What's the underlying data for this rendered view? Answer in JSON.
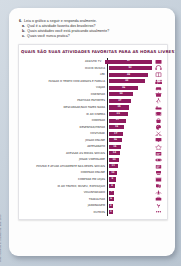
{
  "questions": [
    {
      "marker": "6.",
      "text": "Leia o gráfico a seguir e responda oralmente.",
      "sub": false
    },
    {
      "marker": "a.",
      "text": "Qual é a atividade favorita dos brasileiros?",
      "sub": true
    },
    {
      "marker": "b.",
      "text": "Quais atividades você está praticando atualmente?",
      "sub": true
    },
    {
      "marker": "c.",
      "text": "Quais você nunca pratica?",
      "sub": true
    }
  ],
  "credit": "Foto: ACERVO E. Santos/Arq. Edit. 2013",
  "chart_data": {
    "type": "bar",
    "orientation": "horizontal",
    "title": "QUAIS SÃO SUAS ATIVIDADES FAVORITAS PARA AS HORAS LIVRES?",
    "xlabel": "",
    "ylabel": "",
    "xlim": [
      0,
      60
    ],
    "grid": false,
    "legend": false,
    "categories": [
      "ASSISTIR TV",
      "OUVIR MÚSICA",
      "LER",
      "PASSAR O TEMPO COM AMIGOS E FAMÍLIA",
      "VIAJAR",
      "COZINHAR",
      "PRATICAR ESPORTES",
      "DESCANSAR/NÃO FAZER NADA",
      "IR AO CINEMA",
      "COMPRAR",
      "DESENHAR/PINTAR",
      "COSTURAR",
      "JOGAR ONLINE",
      "ARTESANATO",
      "ACESSAR AS MÍDIAS SOCIAIS",
      "JOGAR VIDEOGAME",
      "POSTAR E ATUAR ATIVAMENTE NAS REDES SOCIAIS",
      "COMPRAR ONLINE",
      "COMPRAR EM LOJAS",
      "IR AO TEATRO, MUSEU, EXPOSIÇÃO",
      "VOLUNTARIADO",
      "TRABALHAR",
      "JARDINAGEM",
      "OUTROS"
    ],
    "values": [
      57,
      52,
      48,
      44,
      36,
      30,
      27,
      25,
      23,
      21,
      19,
      17,
      16,
      15,
      14,
      13,
      11,
      10,
      9,
      8,
      7,
      6,
      4,
      3
    ],
    "icons": [
      "tv-icon",
      "headphones-icon",
      "book-icon",
      "people-icon",
      "car-icon",
      "cooking-pot-icon",
      "sports-icon",
      "bed-icon",
      "film-icon",
      "shopping-bag-icon",
      "palette-icon",
      "scissors-icon",
      "monitor-icon",
      "craft-icon",
      "social-media-icon",
      "gamepad-icon",
      "post-icon",
      "online-cart-icon",
      "store-icon",
      "theater-masks-icon",
      "volunteer-icon",
      "briefcase-icon",
      "plant-icon",
      "dots-icon"
    ],
    "bar_color": "#8e1b5e",
    "label_color": "#ffffff",
    "title_color": "#6a1046"
  }
}
